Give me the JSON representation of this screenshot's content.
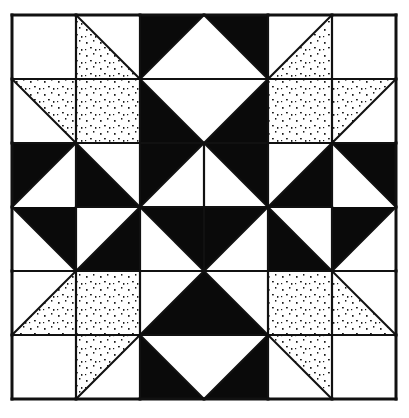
{
  "figure": {
    "kind": "quilt-block",
    "grid": {
      "rows": 6,
      "cols": 6,
      "origin_x": 12,
      "origin_y": 15,
      "cell": 64
    },
    "colors": {
      "background": "#ffffff",
      "black": "#0a0a0a",
      "white": "#ffffff",
      "line": "#111111",
      "dot": "#1a1a1a"
    },
    "fills": [
      "white",
      "black",
      "dotted"
    ],
    "cells": [
      [
        {
          "type": "solid",
          "fill": "white"
        },
        {
          "type": "hst",
          "diag": "tl-br",
          "a": "dotted",
          "b": "white"
        },
        {
          "type": "hst",
          "diag": "bl-tr",
          "a": "black",
          "b": "white"
        },
        {
          "type": "hst",
          "diag": "tl-br",
          "a": "white",
          "b": "black"
        },
        {
          "type": "hst",
          "diag": "bl-tr",
          "a": "white",
          "b": "dotted"
        },
        {
          "type": "solid",
          "fill": "white"
        }
      ],
      [
        {
          "type": "hst",
          "diag": "tl-br",
          "a": "white",
          "b": "dotted"
        },
        {
          "type": "solid",
          "fill": "dotted"
        },
        {
          "type": "hst",
          "diag": "tl-br",
          "a": "black",
          "b": "white"
        },
        {
          "type": "hst",
          "diag": "bl-tr",
          "a": "white",
          "b": "black"
        },
        {
          "type": "solid",
          "fill": "dotted"
        },
        {
          "type": "hst",
          "diag": "bl-tr",
          "a": "dotted",
          "b": "white"
        }
      ],
      [
        {
          "type": "hst",
          "diag": "bl-tr",
          "a": "black",
          "b": "white"
        },
        {
          "type": "hst",
          "diag": "tl-br",
          "a": "black",
          "b": "white"
        },
        {
          "type": "hst",
          "diag": "bl-tr",
          "a": "black",
          "b": "white"
        },
        {
          "type": "hst",
          "diag": "tl-br",
          "a": "white",
          "b": "black"
        },
        {
          "type": "hst",
          "diag": "bl-tr",
          "a": "white",
          "b": "black"
        },
        {
          "type": "hst",
          "diag": "tl-br",
          "a": "white",
          "b": "black"
        }
      ],
      [
        {
          "type": "hst",
          "diag": "tl-br",
          "a": "white",
          "b": "black"
        },
        {
          "type": "hst",
          "diag": "bl-tr",
          "a": "white",
          "b": "black"
        },
        {
          "type": "hst",
          "diag": "tl-br",
          "a": "white",
          "b": "black"
        },
        {
          "type": "hst",
          "diag": "bl-tr",
          "a": "black",
          "b": "white"
        },
        {
          "type": "hst",
          "diag": "tl-br",
          "a": "black",
          "b": "white"
        },
        {
          "type": "hst",
          "diag": "bl-tr",
          "a": "black",
          "b": "white"
        }
      ],
      [
        {
          "type": "hst",
          "diag": "bl-tr",
          "a": "white",
          "b": "dotted"
        },
        {
          "type": "solid",
          "fill": "dotted"
        },
        {
          "type": "hst",
          "diag": "bl-tr",
          "a": "white",
          "b": "black"
        },
        {
          "type": "hst",
          "diag": "tl-br",
          "a": "black",
          "b": "white"
        },
        {
          "type": "solid",
          "fill": "dotted"
        },
        {
          "type": "hst",
          "diag": "tl-br",
          "a": "dotted",
          "b": "white"
        }
      ],
      [
        {
          "type": "solid",
          "fill": "white"
        },
        {
          "type": "hst",
          "diag": "bl-tr",
          "a": "dotted",
          "b": "white"
        },
        {
          "type": "hst",
          "diag": "tl-br",
          "a": "black",
          "b": "white"
        },
        {
          "type": "hst",
          "diag": "bl-tr",
          "a": "white",
          "b": "black"
        },
        {
          "type": "hst",
          "diag": "tl-br",
          "a": "white",
          "b": "dotted"
        },
        {
          "type": "solid",
          "fill": "white"
        }
      ]
    ],
    "hidden_vertical_dividers": [
      {
        "row": 0,
        "between_cols": [
          2,
          3
        ]
      },
      {
        "row": 1,
        "between_cols": [
          2,
          3
        ]
      },
      {
        "row": 4,
        "between_cols": [
          2,
          3
        ]
      },
      {
        "row": 5,
        "between_cols": [
          2,
          3
        ]
      }
    ],
    "hidden_horizontal_dividers": [
      {
        "col": 0,
        "between_rows": [
          2,
          3
        ]
      },
      {
        "col": 5,
        "between_rows": [
          2,
          3
        ]
      }
    ]
  }
}
